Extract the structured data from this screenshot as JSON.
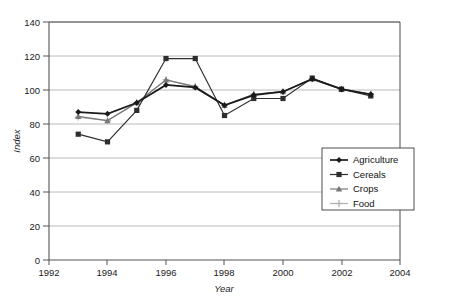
{
  "chart_data": {
    "type": "line",
    "title": "",
    "xlabel": "Year",
    "ylabel": "Index",
    "x": [
      1993,
      1994,
      1995,
      1996,
      1997,
      1998,
      1999,
      2000,
      2001,
      2002,
      2003
    ],
    "xlim": [
      1992,
      2004
    ],
    "ylim": [
      0,
      140
    ],
    "xticks": [
      1992,
      1994,
      1996,
      1998,
      2000,
      2002,
      2004
    ],
    "yticks": [
      0,
      20,
      40,
      60,
      80,
      100,
      120,
      140
    ],
    "grid": "horizontal",
    "legend_position": "lower-right-inside",
    "series": [
      {
        "name": "Agriculture",
        "marker": "diamond",
        "color": "#1a1a1a",
        "values": [
          87,
          86,
          92.5,
          103,
          101.5,
          91,
          97,
          99,
          106.5,
          100.5,
          97.5
        ]
      },
      {
        "name": "Cereals",
        "marker": "square",
        "color": "#2e2e2e",
        "values": [
          74,
          69.5,
          88,
          118.5,
          118.5,
          85,
          95,
          95,
          107,
          100.5,
          96.5
        ]
      },
      {
        "name": "Crops",
        "marker": "triangle",
        "color": "#787878",
        "values": [
          84.5,
          82,
          92.5,
          106,
          102,
          91,
          97.5,
          99,
          106.5,
          100.5,
          97.5
        ]
      },
      {
        "name": "Food",
        "marker": "plus",
        "color": "#b0b0b0",
        "values": [
          84,
          82,
          92.5,
          106,
          102,
          91,
          97.5,
          99,
          106.5,
          100.5,
          97.5
        ]
      }
    ]
  },
  "axes": {
    "y_label": "Index",
    "x_label": "Year",
    "y_tick_labels": [
      "0",
      "20",
      "40",
      "60",
      "80",
      "100",
      "120",
      "140"
    ],
    "x_tick_labels": [
      "1992",
      "1994",
      "1996",
      "1998",
      "2000",
      "2002",
      "2004"
    ]
  },
  "legend": {
    "items": [
      {
        "label": "Agriculture"
      },
      {
        "label": "Cereals"
      },
      {
        "label": "Crops"
      },
      {
        "label": "Food"
      }
    ]
  }
}
